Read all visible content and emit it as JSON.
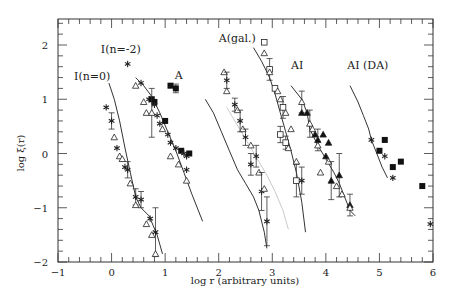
{
  "chart_data": {
    "type": "scatter",
    "title": "",
    "xlabel": "log r  (arbitrary units)",
    "ylabel": "log ξ(r)",
    "xlim": [
      -1,
      6
    ],
    "ylim": [
      -2,
      2.5
    ],
    "x_ticks": [
      -1,
      0,
      1,
      2,
      3,
      4,
      5,
      6
    ],
    "y_ticks": [
      -2,
      -1,
      0,
      1,
      2
    ],
    "grid": false,
    "legend": null,
    "panel_labels": [
      {
        "text": "I(n=0)",
        "x": -0.7,
        "y": 1.35
      },
      {
        "text": "I(n=-2)",
        "x": -0.2,
        "y": 1.85
      },
      {
        "text": "A",
        "x": 1.18,
        "y": 1.38
      },
      {
        "text": "A(gal.)",
        "x": 2.0,
        "y": 2.05
      },
      {
        "text": "AI",
        "x": 3.35,
        "y": 1.55
      },
      {
        "text": "AI (DA)",
        "x": 4.4,
        "y": 1.55
      }
    ],
    "series": [
      {
        "name": "I(n=0)",
        "curve": [
          [
            -0.05,
            1.3
          ],
          [
            0.05,
            1.0
          ],
          [
            0.15,
            0.6
          ],
          [
            0.25,
            0.1
          ],
          [
            0.35,
            -0.35
          ],
          [
            0.45,
            -0.8
          ],
          [
            0.55,
            -1.0
          ],
          [
            0.7,
            -1.15
          ],
          [
            0.85,
            -1.5
          ],
          [
            0.95,
            -1.85
          ]
        ],
        "points": [
          {
            "x": -0.1,
            "y": 0.85,
            "m": "star"
          },
          {
            "x": 0.0,
            "y": 0.6,
            "m": "star",
            "err": 0.15
          },
          {
            "x": 0.05,
            "y": 0.3,
            "m": "tri"
          },
          {
            "x": 0.1,
            "y": 0.1,
            "m": "star"
          },
          {
            "x": 0.15,
            "y": -0.05,
            "m": "tri"
          },
          {
            "x": 0.2,
            "y": -0.1,
            "m": "tri"
          },
          {
            "x": 0.25,
            "y": -0.25,
            "m": "star"
          },
          {
            "x": 0.3,
            "y": -0.3,
            "m": "star",
            "err": 0.15
          },
          {
            "x": 0.35,
            "y": -0.55,
            "m": "tri"
          },
          {
            "x": 0.45,
            "y": -0.8,
            "m": "star",
            "err": 0.15
          },
          {
            "x": 0.45,
            "y": -0.95,
            "m": "tri"
          },
          {
            "x": 0.55,
            "y": -0.85,
            "m": "star",
            "err": 0.15
          },
          {
            "x": 0.65,
            "y": -1.3,
            "m": "tri"
          },
          {
            "x": 0.72,
            "y": -1.2,
            "m": "star"
          },
          {
            "x": 0.75,
            "y": -1.5,
            "m": "tri"
          },
          {
            "x": 0.82,
            "y": -1.45,
            "m": "star",
            "err": 0.45
          },
          {
            "x": 0.82,
            "y": -1.85,
            "m": "tri"
          }
        ]
      },
      {
        "name": "I(n=-2)",
        "curve": [
          [
            0.45,
            1.4
          ],
          [
            0.6,
            1.25
          ],
          [
            0.75,
            1.05
          ],
          [
            0.9,
            0.75
          ],
          [
            1.05,
            0.4
          ],
          [
            1.2,
            0.05
          ],
          [
            1.35,
            -0.35
          ],
          [
            1.5,
            -0.75
          ],
          [
            1.7,
            -1.25
          ]
        ],
        "points": [
          {
            "x": 0.3,
            "y": 1.65,
            "m": "star"
          },
          {
            "x": 0.45,
            "y": 1.25,
            "m": "tri"
          },
          {
            "x": 0.55,
            "y": 1.3,
            "m": "star"
          },
          {
            "x": 0.6,
            "y": 0.95,
            "m": "tri"
          },
          {
            "x": 0.7,
            "y": 1.0,
            "m": "star"
          },
          {
            "x": 0.75,
            "y": 1.0,
            "m": "sq"
          },
          {
            "x": 0.8,
            "y": 0.95,
            "m": "sq"
          },
          {
            "x": 0.8,
            "y": 0.9,
            "m": "star"
          },
          {
            "x": 0.65,
            "y": 0.75,
            "m": "tri"
          },
          {
            "x": 0.75,
            "y": 0.75,
            "m": "tri",
            "err": 0.45
          },
          {
            "x": 0.85,
            "y": 0.7,
            "m": "star"
          },
          {
            "x": 0.9,
            "y": 0.55,
            "m": "star"
          },
          {
            "x": 0.95,
            "y": 0.45,
            "m": "tri"
          },
          {
            "x": 1.0,
            "y": 0.6,
            "m": "sq"
          },
          {
            "x": 1.05,
            "y": 0.35,
            "m": "star"
          },
          {
            "x": 1.1,
            "y": 0.2,
            "m": "star"
          },
          {
            "x": 1.2,
            "y": 0.1,
            "m": "star"
          },
          {
            "x": 1.2,
            "y": 1.2,
            "m": "sq",
            "err": 0.08
          },
          {
            "x": 1.3,
            "y": 0.05,
            "m": "sq"
          },
          {
            "x": 1.35,
            "y": 0.0,
            "m": "star"
          },
          {
            "x": 1.4,
            "y": -0.05,
            "m": "star"
          },
          {
            "x": 1.45,
            "y": 0.0,
            "m": "sq"
          },
          {
            "x": 1.1,
            "y": -0.05,
            "m": "tri"
          },
          {
            "x": 1.25,
            "y": -0.2,
            "m": "tri"
          },
          {
            "x": 1.4,
            "y": -0.3,
            "m": "star"
          },
          {
            "x": 1.4,
            "y": -0.5,
            "m": "tri"
          },
          {
            "x": 1.1,
            "y": 1.25,
            "m": "sq"
          }
        ]
      },
      {
        "name": "A",
        "curve": [
          [
            1.75,
            1.0
          ],
          [
            1.9,
            0.75
          ],
          [
            2.05,
            0.4
          ],
          [
            2.2,
            0.05
          ],
          [
            2.35,
            -0.3
          ],
          [
            2.5,
            -0.55
          ],
          [
            2.65,
            -0.8
          ],
          [
            2.75,
            -1.05
          ],
          [
            2.85,
            -1.45
          ],
          [
            2.9,
            -1.75
          ]
        ],
        "points": [
          {
            "x": 2.1,
            "y": 1.5,
            "m": "tri"
          },
          {
            "x": 2.15,
            "y": 1.35,
            "m": "star",
            "err": 0.15
          },
          {
            "x": 2.15,
            "y": 1.15,
            "m": "tri"
          },
          {
            "x": 2.3,
            "y": 0.9,
            "m": "star",
            "err": 0.12
          },
          {
            "x": 2.35,
            "y": 0.8,
            "m": "tri"
          },
          {
            "x": 2.4,
            "y": 0.6,
            "m": "star",
            "err": 0.2
          },
          {
            "x": 2.45,
            "y": 0.45,
            "m": "tri"
          },
          {
            "x": 2.5,
            "y": 0.3,
            "m": "star",
            "err": 0.15
          },
          {
            "x": 2.6,
            "y": 0.15,
            "m": "tri"
          },
          {
            "x": 2.6,
            "y": -0.2,
            "m": "star",
            "err": 0.2
          },
          {
            "x": 2.7,
            "y": -0.05,
            "m": "star",
            "err": 0.2
          },
          {
            "x": 2.75,
            "y": -0.35,
            "m": "tri"
          },
          {
            "x": 2.8,
            "y": -0.7,
            "m": "star",
            "err": 0.35
          },
          {
            "x": 2.85,
            "y": -0.65,
            "m": "tri"
          },
          {
            "x": 2.9,
            "y": -1.25,
            "m": "star",
            "err": 0.45
          }
        ]
      },
      {
        "name": "A(gal.)",
        "curve": [
          [
            2.65,
            1.95
          ],
          [
            2.8,
            1.7
          ],
          [
            2.95,
            1.4
          ],
          [
            3.05,
            1.1
          ],
          [
            3.15,
            0.75
          ],
          [
            3.25,
            0.4
          ],
          [
            3.35,
            0.05
          ],
          [
            3.45,
            -0.35
          ],
          [
            3.55,
            -0.9
          ],
          [
            3.62,
            -1.45
          ]
        ],
        "points": [
          {
            "x": 2.85,
            "y": 2.05,
            "m": "sqo"
          },
          {
            "x": 2.85,
            "y": 1.85,
            "m": "tri"
          },
          {
            "x": 2.95,
            "y": 1.55,
            "m": "sqo",
            "err": 0.2
          },
          {
            "x": 2.95,
            "y": 1.5,
            "m": "tri"
          },
          {
            "x": 3.05,
            "y": 1.2,
            "m": "sqo"
          },
          {
            "x": 3.1,
            "y": 1.15,
            "m": "tri"
          },
          {
            "x": 3.15,
            "y": 1.0,
            "m": "tri"
          },
          {
            "x": 3.2,
            "y": 0.85,
            "m": "sqo",
            "err": 0.2
          },
          {
            "x": 3.25,
            "y": 0.75,
            "m": "tri"
          },
          {
            "x": 3.35,
            "y": 0.45,
            "m": "tri"
          },
          {
            "x": 3.15,
            "y": 0.35,
            "m": "sqo",
            "err": 0.15
          },
          {
            "x": 3.25,
            "y": 0.2,
            "m": "sqo",
            "err": 0.12
          },
          {
            "x": 3.3,
            "y": 0.1,
            "m": "tri"
          },
          {
            "x": 3.45,
            "y": -0.15,
            "m": "tri"
          },
          {
            "x": 3.45,
            "y": -0.5,
            "m": "sqo",
            "err": 0.3
          },
          {
            "x": 3.55,
            "y": -0.5,
            "m": "star",
            "err": 0.25
          }
        ]
      },
      {
        "name": "A(gal.) faint curve",
        "faint": true,
        "curve": [
          [
            2.15,
            0.85
          ],
          [
            2.3,
            0.6
          ],
          [
            2.45,
            0.35
          ],
          [
            2.6,
            0.1
          ],
          [
            2.75,
            -0.15
          ],
          [
            2.9,
            -0.4
          ],
          [
            3.05,
            -0.7
          ],
          [
            3.2,
            -1.05
          ],
          [
            3.3,
            -1.4
          ]
        ],
        "points": []
      },
      {
        "name": "AI",
        "curve": [
          [
            3.35,
            1.25
          ],
          [
            3.55,
            1.0
          ],
          [
            3.65,
            0.75
          ],
          [
            3.7,
            0.45
          ],
          [
            3.85,
            0.15
          ],
          [
            4.0,
            -0.1
          ],
          [
            4.15,
            -0.35
          ],
          [
            4.25,
            -0.55
          ],
          [
            4.35,
            -0.8
          ],
          [
            4.45,
            -1.05
          ],
          [
            4.55,
            -1.15
          ]
        ],
        "points": [
          {
            "x": 3.55,
            "y": 0.95,
            "m": "tri",
            "err": 0.2
          },
          {
            "x": 3.55,
            "y": 0.75,
            "m": "trif"
          },
          {
            "x": 3.65,
            "y": 0.75,
            "m": "trif"
          },
          {
            "x": 3.7,
            "y": 0.55,
            "m": "tri",
            "err": 0.25
          },
          {
            "x": 3.75,
            "y": 0.45,
            "m": "tri"
          },
          {
            "x": 3.8,
            "y": 0.35,
            "m": "trif"
          },
          {
            "x": 3.85,
            "y": 0.25,
            "m": "trif",
            "err": 0.2
          },
          {
            "x": 3.85,
            "y": 0.15,
            "m": "tri"
          },
          {
            "x": 3.95,
            "y": 0.35,
            "m": "trif"
          },
          {
            "x": 4.05,
            "y": 0.2,
            "m": "trif"
          },
          {
            "x": 4.0,
            "y": -0.05,
            "m": "trif"
          },
          {
            "x": 4.05,
            "y": -0.15,
            "m": "tri"
          },
          {
            "x": 3.9,
            "y": -0.35,
            "m": "tri"
          },
          {
            "x": 4.1,
            "y": -0.5,
            "m": "trif",
            "err": 0.35
          },
          {
            "x": 4.25,
            "y": -0.4,
            "m": "trif",
            "err": 0.4
          },
          {
            "x": 4.2,
            "y": -0.6,
            "m": "tri"
          },
          {
            "x": 4.3,
            "y": -0.75,
            "m": "tri"
          },
          {
            "x": 4.45,
            "y": -0.95,
            "m": "trif",
            "err": 0.2
          },
          {
            "x": 4.45,
            "y": -1.0,
            "m": "tri"
          }
        ]
      },
      {
        "name": "AI (DA)",
        "curve": [
          [
            4.45,
            1.25
          ],
          [
            4.6,
            0.95
          ],
          [
            4.7,
            0.7
          ],
          [
            4.8,
            0.45
          ],
          [
            4.85,
            0.25
          ],
          [
            4.95,
            0.0
          ],
          [
            5.05,
            -0.25
          ],
          [
            5.15,
            -0.45
          ]
        ],
        "points": [
          {
            "x": 4.85,
            "y": 0.25,
            "m": "star"
          },
          {
            "x": 5.1,
            "y": 0.25,
            "m": "sq"
          },
          {
            "x": 5.0,
            "y": 0.05,
            "m": "sq"
          },
          {
            "x": 5.1,
            "y": -0.05,
            "m": "star"
          },
          {
            "x": 5.25,
            "y": -0.25,
            "m": "sq"
          },
          {
            "x": 5.4,
            "y": -0.15,
            "m": "sq"
          },
          {
            "x": 5.25,
            "y": -0.45,
            "m": "star"
          },
          {
            "x": 5.8,
            "y": -0.6,
            "m": "sq"
          },
          {
            "x": 5.95,
            "y": -1.3,
            "m": "star"
          }
        ]
      }
    ]
  },
  "axes": {
    "xlabel": "log r  (arbitrary units)",
    "ylabel": "log ξ(r)"
  }
}
